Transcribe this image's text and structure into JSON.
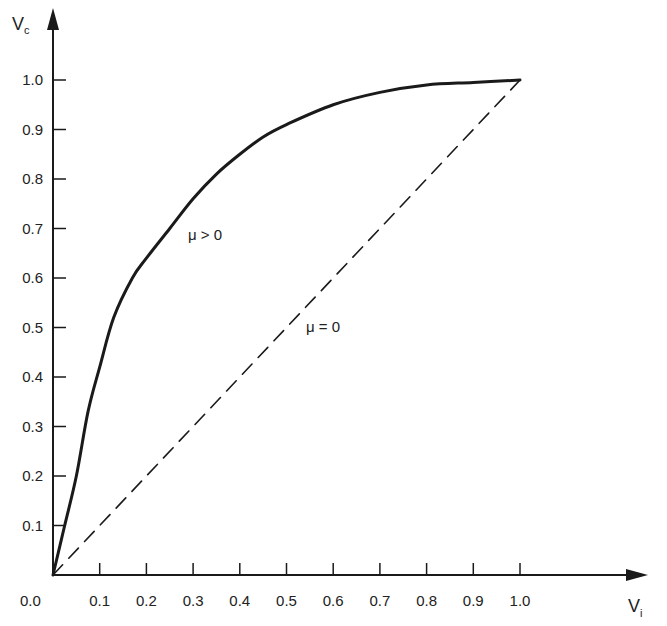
{
  "chart_data": {
    "type": "line",
    "title": "",
    "xlabel": "V_i",
    "ylabel": "V_c",
    "xlabel_main": "V",
    "xlabel_sub": "i",
    "ylabel_main": "V",
    "ylabel_sub": "c",
    "xlim": [
      0.0,
      1.0
    ],
    "ylim": [
      0.0,
      1.0
    ],
    "grid": false,
    "legend": "none (inline annotations)",
    "x_tick_labels": [
      "0.0",
      "0.1",
      "0.2",
      "0.3",
      "0.4",
      "0.5",
      "0.6",
      "0.7",
      "0.8",
      "0.9",
      "1.0"
    ],
    "y_tick_labels": [
      "0.1",
      "0.2",
      "0.3",
      "0.4",
      "0.5",
      "0.6",
      "0.7",
      "0.8",
      "0.9",
      "1.0"
    ],
    "series": [
      {
        "name": "μ > 0",
        "style": "solid",
        "x": [
          0.0,
          0.025,
          0.05,
          0.075,
          0.1,
          0.13,
          0.17,
          0.2,
          0.25,
          0.3,
          0.35,
          0.4,
          0.45,
          0.5,
          0.6,
          0.7,
          0.8,
          0.9,
          1.0
        ],
        "y": [
          0.0,
          0.1,
          0.2,
          0.33,
          0.42,
          0.52,
          0.6,
          0.64,
          0.7,
          0.76,
          0.81,
          0.85,
          0.885,
          0.91,
          0.95,
          0.975,
          0.99,
          0.995,
          1.0
        ]
      },
      {
        "name": "μ = 0",
        "style": "dashed",
        "x": [
          0.0,
          1.0
        ],
        "y": [
          0.0,
          1.0
        ]
      }
    ],
    "annotations": [
      {
        "text": "μ > 0",
        "x": 0.33,
        "y": 0.7
      },
      {
        "text": "μ = 0",
        "x": 0.55,
        "y": 0.48
      }
    ]
  }
}
